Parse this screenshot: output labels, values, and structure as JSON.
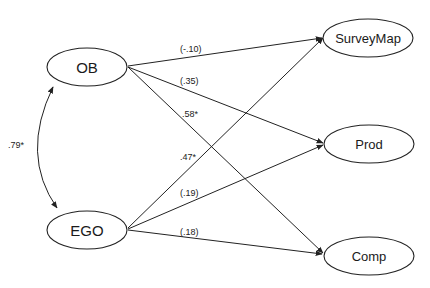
{
  "diagram": {
    "type": "path-model",
    "nodes": [
      {
        "id": "OB",
        "label": "OB",
        "cx": 87,
        "cy": 67,
        "rx": 40,
        "ry": 19,
        "font": "large"
      },
      {
        "id": "EGO",
        "label": "EGO",
        "cx": 87,
        "cy": 230,
        "rx": 40,
        "ry": 19,
        "font": "large"
      },
      {
        "id": "SurveyMap",
        "label": "SurveyMap",
        "cx": 368,
        "cy": 38,
        "rx": 45,
        "ry": 19,
        "font": "small"
      },
      {
        "id": "Prod",
        "label": "Prod",
        "cx": 369,
        "cy": 144,
        "rx": 45,
        "ry": 19,
        "font": "small"
      },
      {
        "id": "Comp",
        "label": "Comp",
        "cx": 369,
        "cy": 256,
        "rx": 45,
        "ry": 19,
        "font": "small"
      }
    ],
    "edges": [
      {
        "from": "OB",
        "to": "SurveyMap",
        "label": "(-.10)",
        "x1": 128,
        "y1": 66,
        "x2": 322,
        "y2": 38,
        "lx": 180,
        "ly": 52
      },
      {
        "from": "OB",
        "to": "Prod",
        "label": "(.35)",
        "x1": 128,
        "y1": 67,
        "x2": 323,
        "y2": 143,
        "lx": 180,
        "ly": 84
      },
      {
        "from": "OB",
        "to": "Comp",
        "label": ".58*",
        "x1": 128,
        "y1": 67,
        "x2": 323,
        "y2": 253,
        "lx": 182,
        "ly": 117
      },
      {
        "from": "EGO",
        "to": "SurveyMap",
        "label": ".47*",
        "x1": 128,
        "y1": 228,
        "x2": 323,
        "y2": 38,
        "lx": 180,
        "ly": 160
      },
      {
        "from": "EGO",
        "to": "Prod",
        "label": "(.19)",
        "x1": 128,
        "y1": 229,
        "x2": 323,
        "y2": 145,
        "lx": 180,
        "ly": 196
      },
      {
        "from": "EGO",
        "to": "Comp",
        "label": "(.18)",
        "x1": 128,
        "y1": 230,
        "x2": 322,
        "y2": 254,
        "lx": 180,
        "ly": 235
      }
    ],
    "correlation": {
      "between": [
        "OB",
        "EGO"
      ],
      "label": ".79*",
      "path": "M 53 87 Q 20 155 57 208",
      "lx": 16,
      "ly": 148
    }
  }
}
